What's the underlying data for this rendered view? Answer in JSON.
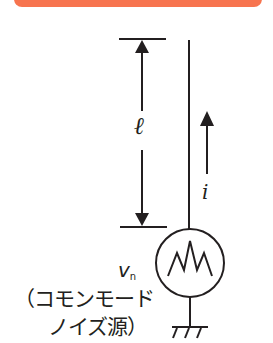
{
  "banner": {
    "color": "#f7744f"
  },
  "diagram": {
    "length_label": "ℓ",
    "current_label": "i",
    "source_voltage_label": "v",
    "source_voltage_subscript": "n",
    "source_description_line1": "（コモンモード",
    "source_description_line2": "ノイズ源）",
    "line_color": "#231f20",
    "components": [
      "dimension-arrow",
      "wire",
      "current-arrow",
      "noise-voltage-source",
      "ground"
    ]
  }
}
